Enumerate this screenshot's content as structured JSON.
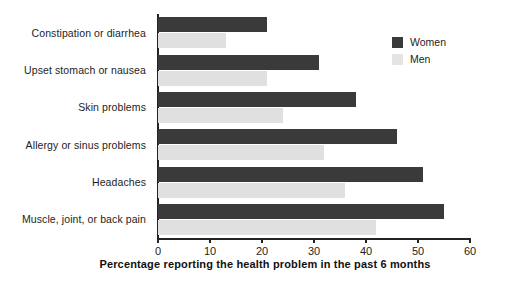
{
  "chart_data": {
    "type": "bar",
    "orientation": "horizontal",
    "title": "",
    "xlabel": "Percentage reporting the health problem in the past 6 months",
    "ylabel": "",
    "xlim": [
      0,
      60
    ],
    "xticks": [
      0,
      10,
      20,
      30,
      40,
      50,
      60
    ],
    "xtick_labels": [
      "0",
      "10",
      "20",
      "30",
      "40",
      "50",
      "60"
    ],
    "grid": false,
    "legend_position": "top-right",
    "categories": [
      "Constipation or diarrhea",
      "Upset stomach or nausea",
      "Skin problems",
      "Allergy or sinus problems",
      "Headaches",
      "Muscle, joint, or back pain"
    ],
    "series": [
      {
        "name": "Women",
        "color": "#3a3a3a",
        "values": [
          21,
          31,
          38,
          46,
          51,
          55
        ]
      },
      {
        "name": "Men",
        "color": "#e0e0e0",
        "values": [
          13,
          21,
          24,
          32,
          36,
          42
        ]
      }
    ]
  },
  "legend": {
    "items": [
      {
        "label": "Women",
        "swatch": "women"
      },
      {
        "label": "Men",
        "swatch": "men"
      }
    ]
  }
}
